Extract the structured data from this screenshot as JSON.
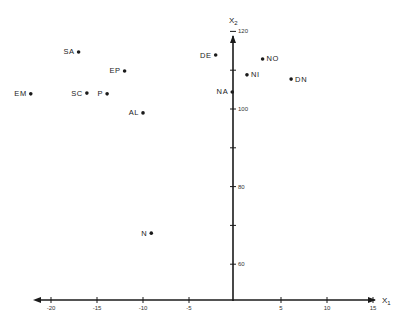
{
  "chart_data": {
    "type": "scatter",
    "title": "",
    "xlabel": "X1",
    "ylabel": "X2",
    "xlim": [
      -22.5,
      15
    ],
    "ylim": [
      50,
      120
    ],
    "x_ticks": [
      -20,
      -15,
      -10,
      -5,
      5,
      10,
      15
    ],
    "x_tick_labels": [
      "-20",
      "-15",
      "-10",
      "-5",
      "5",
      "10",
      "15"
    ],
    "y_ticks": [
      60,
      70,
      80,
      90,
      100,
      110,
      120
    ],
    "y_tick_labels": [
      "60",
      "",
      "80",
      "",
      "100",
      "",
      "120"
    ],
    "grid": false,
    "legend": "none",
    "points": [
      {
        "label": "SA",
        "x": -17.0,
        "y": 114.7,
        "label_side": "left"
      },
      {
        "label": "EP",
        "x": -12.0,
        "y": 109.8,
        "label_side": "left"
      },
      {
        "label": "EM",
        "x": -22.2,
        "y": 103.9,
        "label_side": "left"
      },
      {
        "label": "SC",
        "x": -16.1,
        "y": 104.1,
        "label_side": "left"
      },
      {
        "label": "P",
        "x": -13.9,
        "y": 103.9,
        "label_side": "left"
      },
      {
        "label": "AL",
        "x": -10.0,
        "y": 99.0,
        "label_side": "left"
      },
      {
        "label": "DE",
        "x": -2.1,
        "y": 113.9,
        "label_side": "left"
      },
      {
        "label": "NA",
        "x": -0.3,
        "y": 104.4,
        "label_side": "left"
      },
      {
        "label": "NO",
        "x": 3.0,
        "y": 112.9,
        "label_side": "right"
      },
      {
        "label": "NI",
        "x": 1.3,
        "y": 108.8,
        "label_side": "right"
      },
      {
        "label": "DN",
        "x": 6.1,
        "y": 107.7,
        "label_side": "right"
      },
      {
        "label": "N",
        "x": -9.1,
        "y": 68.0,
        "label_side": "left"
      }
    ]
  },
  "axes": {
    "x_label_main": "X",
    "x_label_sub": "1",
    "y_label_main": "X",
    "y_label_sub": "2"
  },
  "colors": {
    "ink": "#1a1a1a",
    "background": "#ffffff"
  }
}
